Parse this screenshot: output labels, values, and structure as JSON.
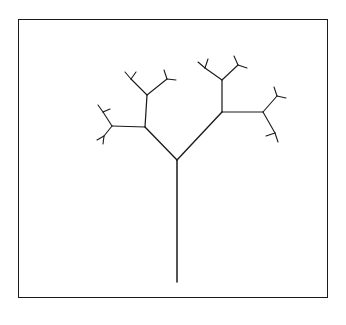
{
  "figure": {
    "title": "",
    "caption": "",
    "background_color": "#ffffff",
    "stroke_color": "#1a1a1a"
  },
  "frame": {
    "name": "bounding-box",
    "x": 18,
    "y": 19,
    "width": 310,
    "height": 279,
    "border_color": "#1a1a1a",
    "border_width": 1.6
  },
  "chart_data": {
    "type": "diagram",
    "subtype": "recursive-fractal-tree",
    "title": "",
    "xlabel": "",
    "ylabel": "",
    "grid": false,
    "legend": null,
    "stroke_color": "#1a1a1a",
    "parameters": {
      "depth": 5,
      "root": [
        177,
        282
      ],
      "trunk_length": 122,
      "trunk_angle_deg": 90,
      "branch_angles_deg": [
        40,
        48
      ],
      "length_scale": 0.62,
      "stroke_width_root": 1.5,
      "stroke_width_tip": 1.1
    },
    "nodes": [
      {
        "id": "root",
        "x": 177,
        "y": 282
      },
      {
        "id": "fork0",
        "x": 177,
        "y": 160
      },
      {
        "id": "L",
        "x": 145,
        "y": 127
      },
      {
        "id": "R",
        "x": 222,
        "y": 112
      },
      {
        "id": "LL",
        "x": 112,
        "y": 126
      },
      {
        "id": "LR",
        "x": 147,
        "y": 95
      },
      {
        "id": "RL",
        "x": 222,
        "y": 80
      },
      {
        "id": "RR",
        "x": 263,
        "y": 112
      },
      {
        "id": "LLL",
        "x": 103,
        "y": 112
      },
      {
        "id": "LLR",
        "x": 104,
        "y": 136
      },
      {
        "id": "LRL",
        "x": 131,
        "y": 79
      },
      {
        "id": "LRR",
        "x": 167,
        "y": 79
      },
      {
        "id": "RLL",
        "x": 205,
        "y": 68
      },
      {
        "id": "RLR",
        "x": 238,
        "y": 65
      },
      {
        "id": "RRL",
        "x": 277,
        "y": 96
      },
      {
        "id": "RRR",
        "x": 275,
        "y": 133
      }
    ],
    "segments": [
      {
        "from": "root",
        "to": "fork0",
        "level": 0
      },
      {
        "from": "fork0",
        "to": "L",
        "level": 1
      },
      {
        "from": "fork0",
        "to": "R",
        "level": 1
      },
      {
        "from": "L",
        "to": "LL",
        "level": 2
      },
      {
        "from": "L",
        "to": "LR",
        "level": 2
      },
      {
        "from": "R",
        "to": "RL",
        "level": 2
      },
      {
        "from": "R",
        "to": "RR",
        "level": 2
      },
      {
        "from": "LL",
        "to": "LLL",
        "level": 3
      },
      {
        "from": "LL",
        "to": "LLR",
        "level": 3
      },
      {
        "from": "LR",
        "to": "LRL",
        "level": 3
      },
      {
        "from": "LR",
        "to": "LRR",
        "level": 3
      },
      {
        "from": "RL",
        "to": "RLL",
        "level": 3
      },
      {
        "from": "RL",
        "to": "RLR",
        "level": 3
      },
      {
        "from": "RR",
        "to": "RRL",
        "level": 3
      },
      {
        "from": "RR",
        "to": "RRR",
        "level": 3
      }
    ],
    "twigs": [
      {
        "parent": "LLL",
        "dx": -5,
        "dy": -7
      },
      {
        "parent": "LLL",
        "dx": 7,
        "dy": -3
      },
      {
        "parent": "LLR",
        "dx": -7,
        "dy": 4
      },
      {
        "parent": "LLR",
        "dx": -1,
        "dy": 8
      },
      {
        "parent": "LRL",
        "dx": -6,
        "dy": -7
      },
      {
        "parent": "LRL",
        "dx": 5,
        "dy": -7
      },
      {
        "parent": "LRR",
        "dx": -3,
        "dy": -9
      },
      {
        "parent": "LRR",
        "dx": 9,
        "dy": 1
      },
      {
        "parent": "RLL",
        "dx": -7,
        "dy": -6
      },
      {
        "parent": "RLL",
        "dx": 3,
        "dy": -9
      },
      {
        "parent": "RLR",
        "dx": -4,
        "dy": -9
      },
      {
        "parent": "RLR",
        "dx": 9,
        "dy": 3
      },
      {
        "parent": "RRL",
        "dx": -3,
        "dy": -9
      },
      {
        "parent": "RRL",
        "dx": 9,
        "dy": 2
      },
      {
        "parent": "RRR",
        "dx": -9,
        "dy": 3
      },
      {
        "parent": "RRR",
        "dx": 3,
        "dy": 9
      }
    ]
  }
}
